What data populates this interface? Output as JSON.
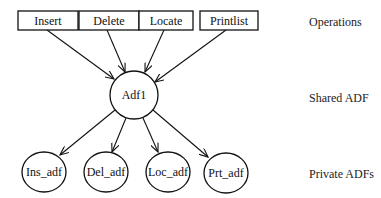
{
  "diagram": {
    "operations": [
      {
        "id": "insert",
        "label": "Insert"
      },
      {
        "id": "delete",
        "label": "Delete"
      },
      {
        "id": "locate",
        "label": "Locate"
      },
      {
        "id": "printlist",
        "label": "Printlist"
      }
    ],
    "shared": {
      "id": "adf1",
      "label": "Adf1"
    },
    "private": [
      {
        "id": "ins_adf",
        "label": "Ins_adf"
      },
      {
        "id": "del_adf",
        "label": "Del_adf"
      },
      {
        "id": "loc_adf",
        "label": "Loc_adf"
      },
      {
        "id": "prt_adf",
        "label": "Prt_adf"
      }
    ],
    "row_labels": {
      "operations": "Operations",
      "shared": "Shared ADF",
      "private": "Private ADFs"
    },
    "edges": [
      [
        "Insert",
        "Adf1"
      ],
      [
        "Delete",
        "Adf1"
      ],
      [
        "Locate",
        "Adf1"
      ],
      [
        "Printlist",
        "Adf1"
      ],
      [
        "Adf1",
        "Ins_adf"
      ],
      [
        "Adf1",
        "Del_adf"
      ],
      [
        "Adf1",
        "Loc_adf"
      ],
      [
        "Adf1",
        "Prt_adf"
      ]
    ]
  }
}
